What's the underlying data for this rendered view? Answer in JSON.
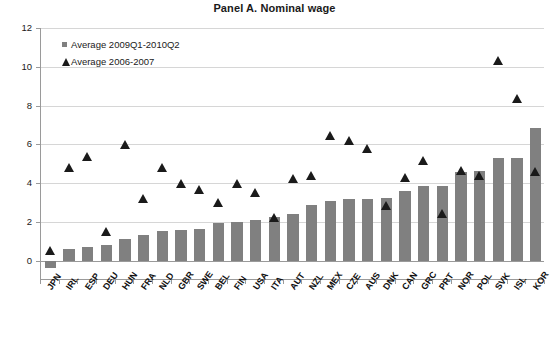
{
  "chart_data": {
    "type": "bar",
    "title": "Panel A. Nominal wage",
    "xlabel": "",
    "ylabel": "",
    "ylim": [
      -1,
      12
    ],
    "yticks": [
      0,
      2,
      4,
      6,
      8,
      10,
      12
    ],
    "grid": true,
    "legend_position": "top-left",
    "categories": [
      "JPN",
      "IRL",
      "ESP",
      "DEU",
      "HUN",
      "FRA",
      "NLD",
      "GBR",
      "SWE",
      "BEL",
      "FIN",
      "USA",
      "ITA",
      "AUT",
      "NZL",
      "MEX",
      "CZE",
      "AUS",
      "DNK",
      "CAN",
      "GRC",
      "PRT",
      "NOR",
      "POL",
      "SVK",
      "ISL",
      "KOR"
    ],
    "series": [
      {
        "name": "Average 2009Q1-2010Q2",
        "marker": "bar",
        "color": "#808080",
        "values": [
          -0.4,
          0.6,
          0.7,
          0.8,
          1.1,
          1.3,
          1.55,
          1.6,
          1.65,
          1.95,
          2.0,
          2.1,
          2.25,
          2.4,
          2.85,
          3.1,
          3.2,
          3.2,
          3.25,
          3.6,
          3.85,
          3.85,
          4.55,
          4.6,
          5.3,
          5.3,
          6.85
        ]
      },
      {
        "name": "Average 2006-2007",
        "marker": "triangle",
        "color": "#1a1a1a",
        "values": [
          0.5,
          4.8,
          5.35,
          1.5,
          6.0,
          3.2,
          4.8,
          4.0,
          3.65,
          3.0,
          4.0,
          3.5,
          2.2,
          4.25,
          4.4,
          6.45,
          6.2,
          5.8,
          2.85,
          4.3,
          5.15,
          2.45,
          4.65,
          4.4,
          10.3,
          8.35,
          4.6
        ]
      }
    ]
  },
  "legend": {
    "items": [
      {
        "label": "Average 2009Q1-2010Q2",
        "marker": "square"
      },
      {
        "label": "Average 2006-2007",
        "marker": "triangle"
      }
    ]
  },
  "colors": {
    "bar": "#808080",
    "marker": "#1a1a1a",
    "axis": "#9a9a9a",
    "grid": "#d6d6d6",
    "text": "#1a1a1a",
    "background": "#ffffff"
  }
}
